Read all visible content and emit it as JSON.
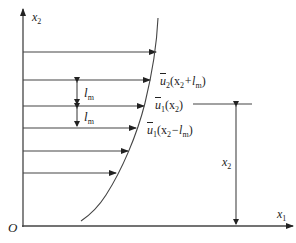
{
  "diagram": {
    "colors": {
      "line": "#333333",
      "text": "#222222",
      "background": "#ffffff"
    },
    "axes": {
      "origin_label": "O",
      "x_label": "x",
      "x_sub": "1",
      "y_label": "x",
      "y_sub": "2"
    },
    "mixing_length_labels": [
      {
        "text": "l",
        "sub": "m"
      },
      {
        "text": "l",
        "sub": "m"
      }
    ],
    "velocity_labels": [
      {
        "text": "u",
        "sub": "2",
        "arg": "(x",
        "arg_sub": "2",
        "arg_tail": "+l",
        "arg_tail_sub": "m",
        "close": ")"
      },
      {
        "text": "u",
        "sub": "1",
        "arg": "(x",
        "arg_sub": "2",
        "close": ")"
      },
      {
        "text": "u",
        "sub": "1",
        "arg": "(x",
        "arg_sub": "2",
        "arg_tail": "−l",
        "arg_tail_sub": "m",
        "close": ")"
      }
    ],
    "height_label": {
      "text": "x",
      "sub": "2"
    },
    "profile_arrows": [
      {
        "y": 52,
        "x_end": 156
      },
      {
        "y": 80,
        "x_end": 150
      },
      {
        "y": 106,
        "x_end": 144
      },
      {
        "y": 128,
        "x_end": 136
      },
      {
        "y": 151,
        "x_end": 128
      },
      {
        "y": 173,
        "x_end": 116
      }
    ]
  }
}
